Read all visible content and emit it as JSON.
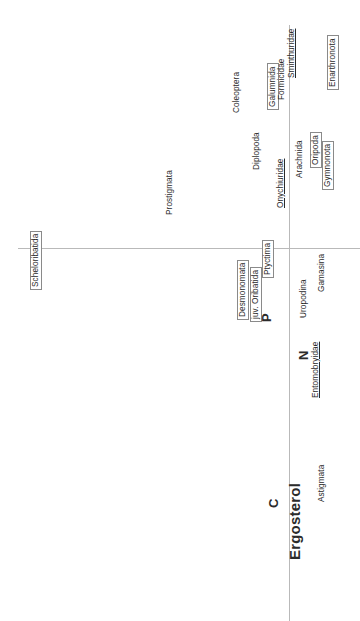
{
  "figure": {
    "title": "Ergosterol",
    "orientation": "rotated-90",
    "axis_color": "#b9b9b9"
  },
  "axes": {
    "horizontal_label": "",
    "vertical_label": ""
  },
  "chart_data": {
    "type": "scatter",
    "title": "Ergosterol",
    "xlabel": "",
    "ylabel": "",
    "grid": false,
    "legend": "none",
    "note": "Ordination biplot (rotated 90 degrees). Points are taxon name labels positioned relative to two crossing axis lines. Boxed labels are a highlighted subgroup; underlined labels are a second emphasis group; bold single letters C, N, P and the bold word Ergosterol are environmental-variable vectors.",
    "axis_lines": [
      {
        "name": "vertical-axis",
        "orientation": "vertical",
        "x": 289,
        "y1": 25,
        "y2": 621
      },
      {
        "name": "horizontal-axis",
        "orientation": "horizontal",
        "y": 248,
        "x1": 18,
        "x2": 360
      }
    ],
    "points": [
      {
        "label": "Scheloribatida",
        "x": 30,
        "y": 290,
        "boxed": true,
        "underline": false,
        "bold": false
      },
      {
        "label": "Prostigmata",
        "x": 166,
        "y": 215,
        "boxed": false,
        "underline": false,
        "bold": false
      },
      {
        "label": "Coleoptera",
        "x": 233,
        "y": 113,
        "boxed": false,
        "underline": false,
        "bold": false
      },
      {
        "label": "Diplopoda",
        "x": 253,
        "y": 170,
        "boxed": false,
        "underline": false,
        "bold": false
      },
      {
        "label": "Galumnida",
        "x": 267,
        "y": 110,
        "boxed": true,
        "underline": false,
        "bold": false
      },
      {
        "label": "Formicidae",
        "x": 278,
        "y": 100,
        "boxed": false,
        "underline": false,
        "bold": false
      },
      {
        "label": "Sminthuridae",
        "x": 288,
        "y": 78,
        "boxed": false,
        "underline": true,
        "bold": false
      },
      {
        "label": "Enarthronota",
        "x": 327,
        "y": 90,
        "boxed": true,
        "underline": false,
        "bold": false
      },
      {
        "label": "Onychiuridae",
        "x": 277,
        "y": 208,
        "boxed": false,
        "underline": true,
        "bold": false
      },
      {
        "label": "Arachnida",
        "x": 296,
        "y": 178,
        "boxed": false,
        "underline": false,
        "bold": false
      },
      {
        "label": "Oripoda",
        "x": 310,
        "y": 168,
        "boxed": true,
        "underline": false,
        "bold": false
      },
      {
        "label": "Gymnonota",
        "x": 322,
        "y": 190,
        "boxed": true,
        "underline": false,
        "bold": false
      },
      {
        "label": "Desmonomata",
        "x": 237,
        "y": 320,
        "boxed": true,
        "underline": false,
        "bold": false
      },
      {
        "label": "juv. Oribatida",
        "x": 250,
        "y": 322,
        "boxed": true,
        "underline": false,
        "bold": false
      },
      {
        "label": "Ptyctima",
        "x": 262,
        "y": 278,
        "boxed": true,
        "underline": false,
        "bold": false
      },
      {
        "label": "Uropodina",
        "x": 300,
        "y": 318,
        "boxed": false,
        "underline": false,
        "bold": false
      },
      {
        "label": "Gamasina",
        "x": 318,
        "y": 292,
        "boxed": false,
        "underline": false,
        "bold": false
      },
      {
        "label": "Entomobryidae",
        "x": 312,
        "y": 398,
        "boxed": false,
        "underline": true,
        "bold": false
      },
      {
        "label": "Astigmata",
        "x": 318,
        "y": 502,
        "boxed": false,
        "underline": false,
        "bold": false
      }
    ],
    "vectors": [
      {
        "label": "P",
        "x": 260,
        "y": 322,
        "style": "mid"
      },
      {
        "label": "N",
        "x": 297,
        "y": 360,
        "style": "mid"
      },
      {
        "label": "C",
        "x": 267,
        "y": 508,
        "style": "mid"
      },
      {
        "label": "Ergosterol",
        "x": 287,
        "y": 560,
        "style": "big"
      }
    ]
  }
}
